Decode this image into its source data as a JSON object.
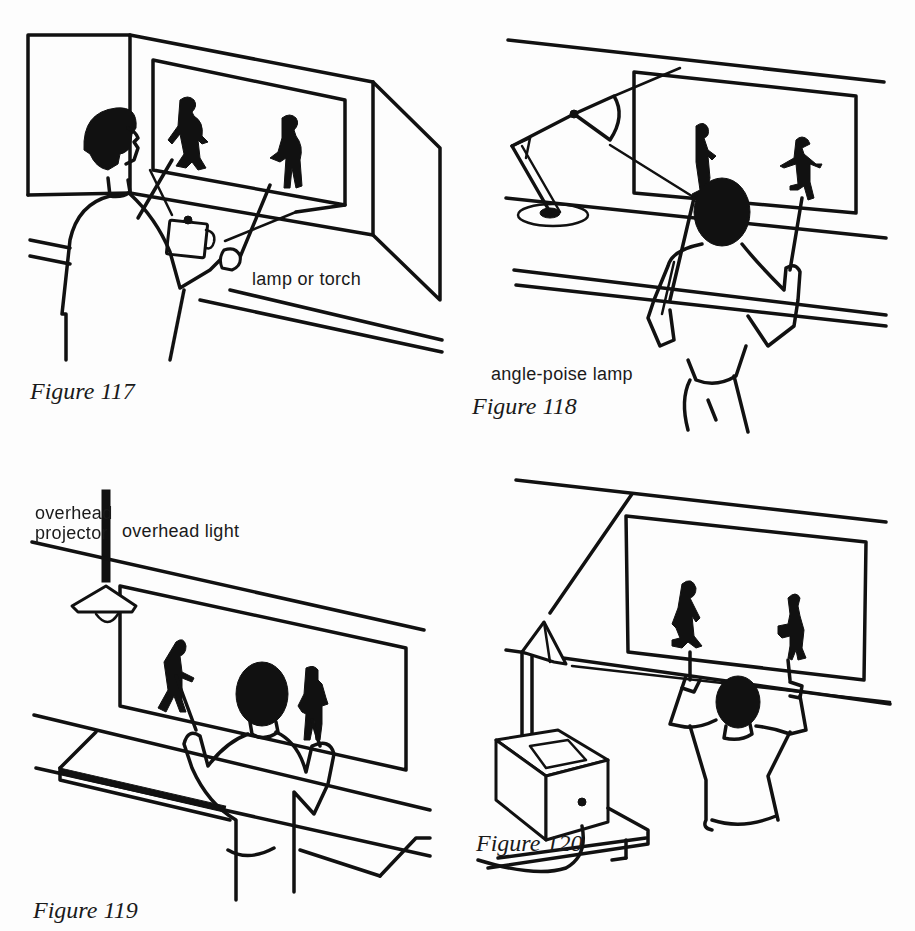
{
  "figures": [
    {
      "id": "117",
      "caption": "Figure 117",
      "labels": [
        "lamp or torch"
      ],
      "description": "Person holding shadow puppets on rods behind a screen lit by a lamp on the table"
    },
    {
      "id": "118",
      "caption": "Figure 118",
      "labels": [
        "angle-poise lamp"
      ],
      "description": "Person seen from behind holding two shadow puppets against a screen lit by an angle-poise lamp"
    },
    {
      "id": "119",
      "caption": "Figure 119",
      "labels": [
        "overhead light"
      ],
      "description": "Person seen from behind holding two shadow puppets under an overhead hanging light"
    },
    {
      "id": "120",
      "caption": "Figure 120",
      "labels": [
        "overhead",
        "projector"
      ],
      "description": "Person seen from behind holding two shadow puppets on a screen lit by an overhead projector"
    }
  ]
}
